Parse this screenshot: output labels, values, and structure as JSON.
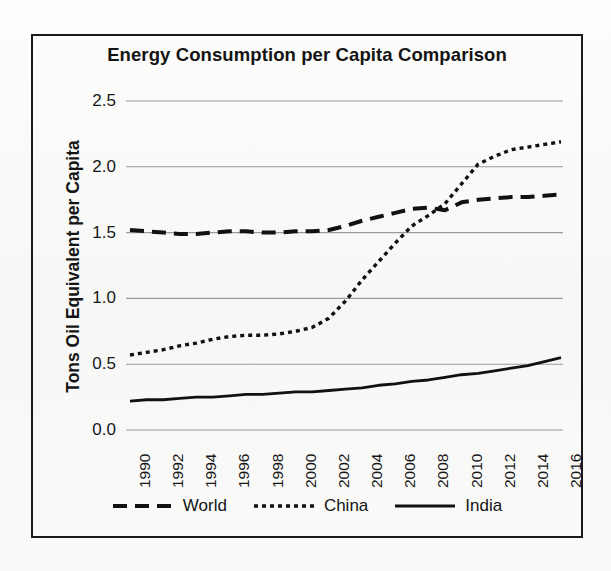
{
  "figure": {
    "title": "Energy Consumption per Capita Comparison",
    "y_axis_title": "Tons Oil Equivalent per Capita",
    "x_axis_title": "",
    "frame_color": "#1a1a1a",
    "grid_color": "#9a9a9a",
    "series_color": "#111111"
  },
  "legend": {
    "position": "bottom-center",
    "entries": [
      {
        "label": "World",
        "dash_style": "dashed",
        "swatch": "dashed-line-swatch"
      },
      {
        "label": "China",
        "dash_style": "dotted",
        "swatch": "dotted-line-swatch"
      },
      {
        "label": "India",
        "dash_style": "solid",
        "swatch": "solid-line-swatch"
      }
    ]
  },
  "axes": {
    "y_ticks": [
      "2.5",
      "2.0",
      "1.5",
      "1.0",
      "0.5",
      "0.0"
    ],
    "x_ticks": [
      "1990",
      "1992",
      "1994",
      "1996",
      "1998",
      "2000",
      "2002",
      "2004",
      "2006",
      "2008",
      "2010",
      "2012",
      "2014",
      "2016"
    ]
  },
  "chart_data": {
    "type": "line",
    "title": "Energy Consumption per Capita Comparison",
    "xlabel": "",
    "ylabel": "Tons Oil Equivalent per Capita",
    "ylim": [
      0.0,
      2.5
    ],
    "xlim": [
      1990,
      2016
    ],
    "grid": true,
    "legend_position": "bottom-center",
    "x": [
      1990,
      1991,
      1992,
      1993,
      1994,
      1995,
      1996,
      1997,
      1998,
      1999,
      2000,
      2001,
      2002,
      2003,
      2004,
      2005,
      2006,
      2007,
      2008,
      2009,
      2010,
      2011,
      2012,
      2013,
      2014,
      2015,
      2016
    ],
    "series": [
      {
        "name": "World",
        "dash_style": "dashed",
        "values": [
          1.52,
          1.51,
          1.5,
          1.49,
          1.49,
          1.5,
          1.51,
          1.51,
          1.5,
          1.5,
          1.51,
          1.51,
          1.52,
          1.55,
          1.59,
          1.62,
          1.65,
          1.68,
          1.69,
          1.67,
          1.73,
          1.75,
          1.76,
          1.77,
          1.77,
          1.78,
          1.79
        ]
      },
      {
        "name": "China",
        "dash_style": "dotted",
        "values": [
          0.57,
          0.59,
          0.61,
          0.64,
          0.66,
          0.69,
          0.71,
          0.72,
          0.72,
          0.73,
          0.75,
          0.78,
          0.85,
          0.98,
          1.14,
          1.28,
          1.42,
          1.55,
          1.63,
          1.72,
          1.87,
          2.02,
          2.08,
          2.13,
          2.15,
          2.17,
          2.19
        ]
      },
      {
        "name": "India",
        "dash_style": "solid",
        "values": [
          0.22,
          0.23,
          0.23,
          0.24,
          0.25,
          0.25,
          0.26,
          0.27,
          0.27,
          0.28,
          0.29,
          0.29,
          0.3,
          0.31,
          0.32,
          0.34,
          0.35,
          0.37,
          0.38,
          0.4,
          0.42,
          0.43,
          0.45,
          0.47,
          0.49,
          0.52,
          0.55
        ]
      }
    ]
  }
}
